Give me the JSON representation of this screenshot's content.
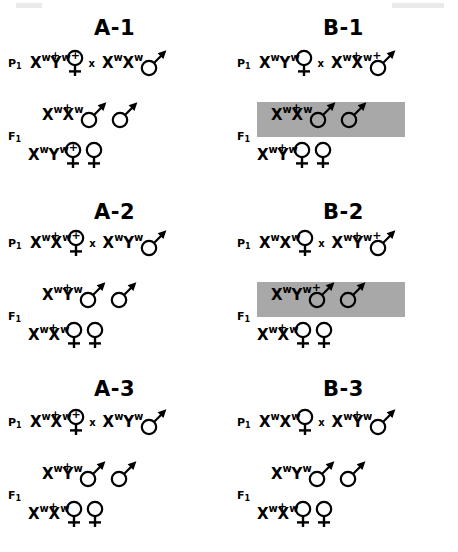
{
  "figure": {
    "cross_symbol": "x",
    "gen_labels": {
      "p": "P",
      "f": "F",
      "subscript": "1"
    },
    "symbols": {
      "male": "male-symbol",
      "female": "female-symbol"
    },
    "shade_color": "#a8a8a8"
  },
  "panels": [
    {
      "id": "A-1",
      "title": "A-1",
      "p_label": "P",
      "p_sub": "1",
      "f_label": "F",
      "f_sub": "1",
      "p_mother": {
        "alleles": [
          {
            "gene": "X",
            "sup": "w",
            "plus": true
          },
          {
            "gene": "Y",
            "sup": "w",
            "plus": true
          }
        ],
        "sex": "female",
        "count": 1
      },
      "p_father": {
        "alleles": [
          {
            "gene": "X",
            "sup": "w",
            "plus": false
          },
          {
            "gene": "X",
            "sup": "w",
            "plus": false
          }
        ],
        "sex": "male",
        "count": 1
      },
      "f_sons": {
        "alleles": [
          {
            "gene": "X",
            "sup": "w",
            "plus": true
          },
          {
            "gene": "X",
            "sup": "w",
            "plus": false
          }
        ],
        "sex": "male",
        "count": 2,
        "shaded": false
      },
      "f_daughters": {
        "alleles": [
          {
            "gene": "X",
            "sup": "w",
            "plus": false
          },
          {
            "gene": "Y",
            "sup": "w",
            "plus": true
          }
        ],
        "sex": "female",
        "count": 2,
        "shaded": false
      }
    },
    {
      "id": "B-1",
      "title": "B-1",
      "p_label": "P",
      "p_sub": "1",
      "f_label": "F",
      "f_sub": "1",
      "p_mother": {
        "alleles": [
          {
            "gene": "X",
            "sup": "w",
            "plus": false
          },
          {
            "gene": "Y",
            "sup": "w",
            "plus": false
          }
        ],
        "sex": "female",
        "count": 1
      },
      "p_father": {
        "alleles": [
          {
            "gene": "X",
            "sup": "w",
            "plus": true
          },
          {
            "gene": "X",
            "sup": "w",
            "plus": true
          }
        ],
        "sex": "male",
        "count": 1
      },
      "f_sons": {
        "alleles": [
          {
            "gene": "X",
            "sup": "w",
            "plus": true
          },
          {
            "gene": "X",
            "sup": "w",
            "plus": false
          }
        ],
        "sex": "male",
        "count": 2,
        "shaded": true
      },
      "f_daughters": {
        "alleles": [
          {
            "gene": "X",
            "sup": "w",
            "plus": true
          },
          {
            "gene": "Y",
            "sup": "w",
            "plus": false
          }
        ],
        "sex": "female",
        "count": 2,
        "shaded": false
      }
    },
    {
      "id": "A-2",
      "title": "A-2",
      "p_label": "P",
      "p_sub": "1",
      "f_label": "F",
      "f_sub": "1",
      "p_mother": {
        "alleles": [
          {
            "gene": "X",
            "sup": "w",
            "plus": true
          },
          {
            "gene": "X",
            "sup": "w",
            "plus": true
          }
        ],
        "sex": "female",
        "count": 1
      },
      "p_father": {
        "alleles": [
          {
            "gene": "X",
            "sup": "w",
            "plus": false
          },
          {
            "gene": "Y",
            "sup": "w",
            "plus": false
          }
        ],
        "sex": "male",
        "count": 1
      },
      "f_sons": {
        "alleles": [
          {
            "gene": "X",
            "sup": "w",
            "plus": true
          },
          {
            "gene": "Y",
            "sup": "w",
            "plus": false
          }
        ],
        "sex": "male",
        "count": 2,
        "shaded": false
      },
      "f_daughters": {
        "alleles": [
          {
            "gene": "X",
            "sup": "w",
            "plus": true
          },
          {
            "gene": "X",
            "sup": "w",
            "plus": false
          }
        ],
        "sex": "female",
        "count": 2,
        "shaded": false
      }
    },
    {
      "id": "B-2",
      "title": "B-2",
      "p_label": "P",
      "p_sub": "1",
      "f_label": "F",
      "f_sub": "1",
      "p_mother": {
        "alleles": [
          {
            "gene": "X",
            "sup": "w",
            "plus": false
          },
          {
            "gene": "X",
            "sup": "w",
            "plus": false
          }
        ],
        "sex": "female",
        "count": 1
      },
      "p_father": {
        "alleles": [
          {
            "gene": "X",
            "sup": "w",
            "plus": true
          },
          {
            "gene": "Y",
            "sup": "w",
            "plus": true
          }
        ],
        "sex": "male",
        "count": 1
      },
      "f_sons": {
        "alleles": [
          {
            "gene": "X",
            "sup": "w",
            "plus": false
          },
          {
            "gene": "Y",
            "sup": "w",
            "plus": true
          }
        ],
        "sex": "male",
        "count": 2,
        "shaded": true
      },
      "f_daughters": {
        "alleles": [
          {
            "gene": "X",
            "sup": "w",
            "plus": true
          },
          {
            "gene": "X",
            "sup": "w",
            "plus": false
          }
        ],
        "sex": "female",
        "count": 2,
        "shaded": false
      }
    },
    {
      "id": "A-3",
      "title": "A-3",
      "p_label": "P",
      "p_sub": "1",
      "f_label": "F",
      "f_sub": "1",
      "p_mother": {
        "alleles": [
          {
            "gene": "X",
            "sup": "w",
            "plus": true
          },
          {
            "gene": "X",
            "sup": "w",
            "plus": true
          }
        ],
        "sex": "female",
        "count": 1
      },
      "p_father": {
        "alleles": [
          {
            "gene": "X",
            "sup": "w",
            "plus": false
          },
          {
            "gene": "Y",
            "sup": "w",
            "plus": false
          }
        ],
        "sex": "male",
        "count": 1
      },
      "f_sons": {
        "alleles": [
          {
            "gene": "X",
            "sup": "w",
            "plus": true
          },
          {
            "gene": "Y",
            "sup": "w",
            "plus": false
          }
        ],
        "sex": "male",
        "count": 2,
        "shaded": false
      },
      "f_daughters": {
        "alleles": [
          {
            "gene": "X",
            "sup": "w",
            "plus": true
          },
          {
            "gene": "X",
            "sup": "w",
            "plus": false
          }
        ],
        "sex": "female",
        "count": 2,
        "shaded": false
      }
    },
    {
      "id": "B-3",
      "title": "B-3",
      "p_label": "P",
      "p_sub": "1",
      "f_label": "F",
      "f_sub": "1",
      "p_mother": {
        "alleles": [
          {
            "gene": "X",
            "sup": "w",
            "plus": false
          },
          {
            "gene": "X",
            "sup": "w",
            "plus": false
          }
        ],
        "sex": "female",
        "count": 1
      },
      "p_father": {
        "alleles": [
          {
            "gene": "X",
            "sup": "w",
            "plus": true
          },
          {
            "gene": "Y",
            "sup": "w",
            "plus": false
          }
        ],
        "sex": "male",
        "count": 1
      },
      "f_sons": {
        "alleles": [
          {
            "gene": "X",
            "sup": "w",
            "plus": false
          },
          {
            "gene": "Y",
            "sup": "w",
            "plus": false
          }
        ],
        "sex": "male",
        "count": 2,
        "shaded": false
      },
      "f_daughters": {
        "alleles": [
          {
            "gene": "X",
            "sup": "w",
            "plus": true
          },
          {
            "gene": "X",
            "sup": "w",
            "plus": false
          }
        ],
        "sex": "female",
        "count": 2,
        "shaded": false
      }
    }
  ]
}
